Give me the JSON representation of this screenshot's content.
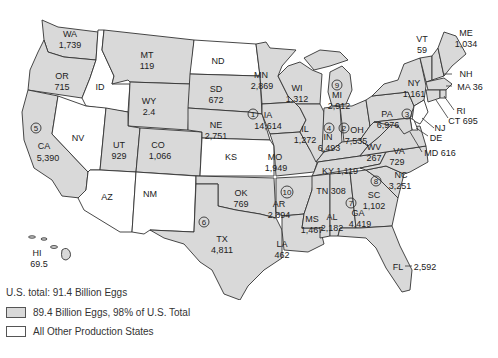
{
  "colors": {
    "top_states_fill": "#d9d9d9",
    "other_states_fill": "#ffffff",
    "border": "#333333"
  },
  "legend": {
    "total_label": "U.S. total: 91.4 Billion Eggs",
    "items": [
      {
        "label": "89.4 Billion Eggs, 98% of U.S. Total",
        "fill": "#d9d9d9"
      },
      {
        "label": "All Other Production States",
        "fill": "#ffffff"
      }
    ]
  },
  "states": {
    "WA": {
      "abbr": "WA",
      "value": "1,739"
    },
    "OR": {
      "abbr": "OR",
      "value": "715"
    },
    "CA": {
      "abbr": "CA",
      "value": "5,390",
      "rank": "5"
    },
    "ID": {
      "abbr": "ID"
    },
    "NV": {
      "abbr": "NV"
    },
    "MT": {
      "abbr": "MT",
      "value": "119"
    },
    "WY": {
      "abbr": "WY",
      "value": "2.4"
    },
    "UT": {
      "abbr": "UT",
      "value": "929"
    },
    "CO": {
      "abbr": "CO",
      "value": "1,066"
    },
    "AZ": {
      "abbr": "AZ"
    },
    "NM": {
      "abbr": "NM"
    },
    "ND": {
      "abbr": "ND"
    },
    "SD": {
      "abbr": "SD",
      "value": "672"
    },
    "NE": {
      "abbr": "NE",
      "value": "2,751"
    },
    "KS": {
      "abbr": "KS"
    },
    "OK": {
      "abbr": "OK",
      "value": "769"
    },
    "TX": {
      "abbr": "TX",
      "value": "4,811",
      "rank": "6"
    },
    "MN": {
      "abbr": "MN",
      "value": "2,869"
    },
    "IA": {
      "abbr": "IA",
      "value": "14,614",
      "rank": "1"
    },
    "MO": {
      "abbr": "MO",
      "value": "1,949"
    },
    "AR": {
      "abbr": "AR",
      "value": "2,894",
      "rank": "10"
    },
    "LA": {
      "abbr": "LA",
      "value": "462"
    },
    "WI": {
      "abbr": "WI",
      "value": "1,312"
    },
    "IL": {
      "abbr": "IL",
      "value": "1,272"
    },
    "MI": {
      "abbr": "MI",
      "value": "2,912",
      "rank": "9"
    },
    "IN": {
      "abbr": "IN",
      "value": "6,493",
      "rank": "4"
    },
    "OH": {
      "abbr": "OH",
      "value": "7,535",
      "rank": "2"
    },
    "KY": {
      "abbr": "KY",
      "value": "1,119"
    },
    "TN": {
      "abbr": "TN",
      "value": "308"
    },
    "MS": {
      "abbr": "MS",
      "value": "1,467"
    },
    "AL": {
      "abbr": "AL",
      "value": "2,182"
    },
    "GA": {
      "abbr": "GA",
      "value": "4,419",
      "rank": "7"
    },
    "FL": {
      "abbr": "FL",
      "value": "2,592"
    },
    "SC": {
      "abbr": "SC",
      "value": "1,102"
    },
    "NC": {
      "abbr": "NC",
      "value": "3,251",
      "rank": "8"
    },
    "VA": {
      "abbr": "VA",
      "value": "729"
    },
    "WV": {
      "abbr": "WV",
      "value": "267"
    },
    "PA": {
      "abbr": "PA",
      "value": "6,976",
      "rank": "3"
    },
    "NY": {
      "abbr": "NY",
      "value": "1,161"
    },
    "VT": {
      "abbr": "VT",
      "value": "59"
    },
    "NH": {
      "abbr": "NH"
    },
    "ME": {
      "abbr": "ME",
      "value": "1,034"
    },
    "MA": {
      "abbr": "MA",
      "value": "36",
      "text": "MA 36"
    },
    "RI": {
      "abbr": "RI"
    },
    "CT": {
      "abbr": "CT",
      "value": "695",
      "text": "CT 695"
    },
    "NJ": {
      "abbr": "NJ"
    },
    "DE": {
      "abbr": "DE"
    },
    "MD": {
      "abbr": "MD",
      "value": "616",
      "text": "MD 616"
    },
    "HI": {
      "abbr": "HI",
      "value": "69.5"
    },
    "KY_text": "KY 1,119",
    "TN_text": "TN 308"
  }
}
